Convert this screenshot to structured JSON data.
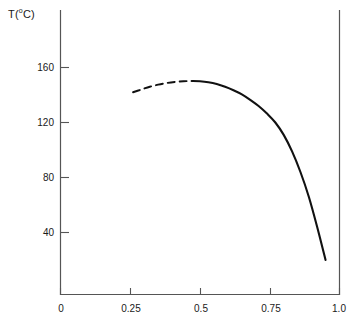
{
  "figure": {
    "background": "#ffffff",
    "line_color": "#111111",
    "axis_color": "#555555"
  },
  "chart_data": {
    "type": "line",
    "title": "",
    "xlabel": "",
    "ylabel": "T(°C)",
    "ylabel_text": "T(",
    "ylabel_sup": "o",
    "ylabel_tail": "C)",
    "xlim": [
      0,
      1.0
    ],
    "ylim": [
      0,
      193
    ],
    "grid": false,
    "legend": null,
    "xticks": [
      0,
      0.25,
      0.5,
      0.75,
      1.0
    ],
    "xticklabels": [
      "0",
      "0.25",
      "0.5",
      "0.75",
      "1.0"
    ],
    "yticks": [
      40,
      80,
      120,
      160
    ],
    "yticklabels": [
      "40",
      "80",
      "120",
      "160"
    ],
    "series": [
      {
        "name": "T extrapolated",
        "style": "dashed",
        "x": [
          0.26,
          0.29,
          0.32,
          0.35,
          0.38,
          0.41,
          0.44,
          0.47
        ],
        "values": [
          142,
          144,
          146,
          147.5,
          148.7,
          149.5,
          150,
          150.2
        ]
      },
      {
        "name": "T measured",
        "style": "solid",
        "x": [
          0.47,
          0.5,
          0.53,
          0.56,
          0.59,
          0.62,
          0.65,
          0.68,
          0.71,
          0.74,
          0.77,
          0.8,
          0.83,
          0.86,
          0.89,
          0.92,
          0.95
        ],
        "values": [
          150.2,
          150,
          149.3,
          148,
          146,
          143.5,
          140.5,
          136.5,
          132,
          126.5,
          120,
          111,
          99,
          84,
          66,
          44,
          20
        ]
      }
    ]
  }
}
